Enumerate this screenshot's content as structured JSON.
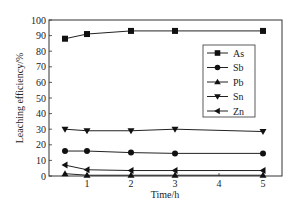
{
  "chart_data": {
    "type": "line",
    "title": "",
    "xlabel": "Time/h",
    "ylabel": "Leaching efficiency/%",
    "xlim": [
      0,
      5.45
    ],
    "ylim": [
      0,
      100
    ],
    "xticks": [
      1,
      2,
      3,
      4,
      5
    ],
    "yticks": [
      0,
      10,
      20,
      30,
      40,
      50,
      60,
      70,
      80,
      90,
      100
    ],
    "grid": false,
    "legend_position": "upper right (inside)",
    "x": [
      0.5,
      1,
      2,
      3,
      5
    ],
    "series": [
      {
        "name": "As",
        "marker": "square",
        "values": [
          88,
          91,
          93,
          93,
          93
        ]
      },
      {
        "name": "Sb",
        "marker": "circle",
        "values": [
          16,
          16,
          15,
          14.5,
          14.5
        ]
      },
      {
        "name": "Pb",
        "marker": "triangle-up",
        "values": [
          1.5,
          0.5,
          0.5,
          0.5,
          0.5
        ]
      },
      {
        "name": "Sn",
        "marker": "triangle-down",
        "values": [
          30,
          29,
          29,
          30,
          28.5
        ]
      },
      {
        "name": "Zn",
        "marker": "triangle-left",
        "values": [
          7,
          4,
          3.5,
          3.5,
          3.5
        ]
      }
    ]
  }
}
